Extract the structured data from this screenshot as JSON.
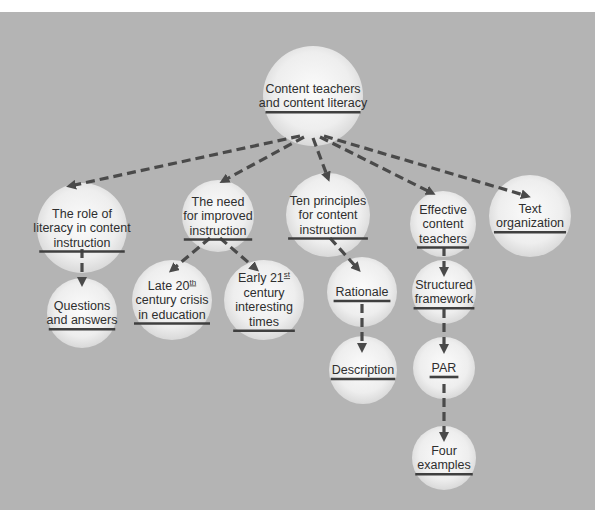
{
  "diagram": {
    "colors": {
      "background": "#b4b4b4",
      "node_fill_center": "#fafafa",
      "node_fill_edge": "#dedede",
      "edge": "#4a4a4a",
      "text": "#2e2e2e"
    },
    "nodes": [
      {
        "id": "root",
        "lines": [
          "Content teachers",
          "and content literacy"
        ],
        "cx": 313,
        "cy": 96,
        "r": 50
      },
      {
        "id": "role",
        "lines": [
          "The role of",
          "literacy in content",
          "instruction"
        ],
        "cx": 82,
        "cy": 228,
        "r": 45
      },
      {
        "id": "need",
        "lines": [
          "The need",
          "for improved",
          "instruction"
        ],
        "cx": 218,
        "cy": 216,
        "r": 36
      },
      {
        "id": "ten",
        "lines": [
          "Ten principles",
          "for content",
          "instruction"
        ],
        "cx": 328,
        "cy": 215,
        "r": 42
      },
      {
        "id": "effective",
        "lines": [
          "Effective",
          "content",
          "teachers"
        ],
        "cx": 443,
        "cy": 224,
        "r": 33
      },
      {
        "id": "textorg",
        "lines": [
          "Text",
          "organization"
        ],
        "cx": 530,
        "cy": 216,
        "r": 41
      },
      {
        "id": "qa",
        "lines": [
          "Questions",
          "and answers"
        ],
        "cx": 82,
        "cy": 313,
        "r": 35
      },
      {
        "id": "late20",
        "lines": [
          "Late 20|th",
          "century crisis",
          "in education"
        ],
        "cx": 172,
        "cy": 300,
        "r": 40
      },
      {
        "id": "early21",
        "lines": [
          "Early 21|st",
          "century",
          "interesting",
          "times"
        ],
        "cx": 264,
        "cy": 300,
        "r": 40
      },
      {
        "id": "rationale",
        "lines": [
          "Rationale"
        ],
        "cx": 362,
        "cy": 292,
        "r": 35
      },
      {
        "id": "description",
        "lines": [
          "Description"
        ],
        "cx": 363,
        "cy": 370,
        "r": 34
      },
      {
        "id": "structured",
        "lines": [
          "Structured",
          "framework"
        ],
        "cx": 444,
        "cy": 292,
        "r": 32
      },
      {
        "id": "par",
        "lines": [
          "PAR"
        ],
        "cx": 444,
        "cy": 368,
        "r": 31
      },
      {
        "id": "four",
        "lines": [
          "Four",
          "examples"
        ],
        "cx": 444,
        "cy": 458,
        "r": 32
      }
    ],
    "edges": [
      {
        "from": "root",
        "to": "role",
        "x1": 300,
        "y1": 136,
        "x2": 70,
        "y2": 186
      },
      {
        "from": "root",
        "to": "need",
        "x1": 304,
        "y1": 137,
        "x2": 223,
        "y2": 181
      },
      {
        "from": "root",
        "to": "ten",
        "x1": 313,
        "y1": 138,
        "x2": 328,
        "y2": 178
      },
      {
        "from": "root",
        "to": "effective",
        "x1": 320,
        "y1": 137,
        "x2": 432,
        "y2": 193
      },
      {
        "from": "root",
        "to": "textorg",
        "x1": 324,
        "y1": 136,
        "x2": 527,
        "y2": 196
      },
      {
        "from": "role",
        "to": "qa",
        "x1": 82,
        "y1": 249,
        "x2": 82,
        "y2": 283
      },
      {
        "from": "need",
        "to": "late20",
        "x1": 210,
        "y1": 238,
        "x2": 172,
        "y2": 270
      },
      {
        "from": "need",
        "to": "early21",
        "x1": 220,
        "y1": 238,
        "x2": 256,
        "y2": 269
      },
      {
        "from": "ten",
        "to": "rationale",
        "x1": 330,
        "y1": 238,
        "x2": 358,
        "y2": 269
      },
      {
        "from": "rationale",
        "to": "description",
        "x1": 362,
        "y1": 304,
        "x2": 362,
        "y2": 349
      },
      {
        "from": "effective",
        "to": "structured",
        "x1": 444,
        "y1": 247,
        "x2": 444,
        "y2": 273
      },
      {
        "from": "structured",
        "to": "par",
        "x1": 444,
        "y1": 309,
        "x2": 444,
        "y2": 350
      },
      {
        "from": "par",
        "to": "four",
        "x1": 444,
        "y1": 384,
        "x2": 444,
        "y2": 438
      }
    ]
  }
}
